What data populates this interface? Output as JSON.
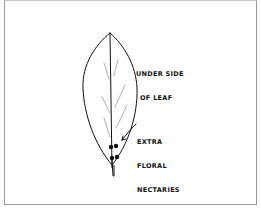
{
  "figure": {
    "subject": "Leaf",
    "labels": {
      "underside": [
        "UNDER SIDE",
        "OF LEAF"
      ],
      "nectaries": [
        "EXTRA",
        "FLORAL",
        "NECTARIES",
        "(4)"
      ]
    },
    "nectary_count": 4,
    "colors": {
      "ink": "#111111",
      "frame": "#9a9a9a",
      "background": "#ffffff"
    }
  }
}
